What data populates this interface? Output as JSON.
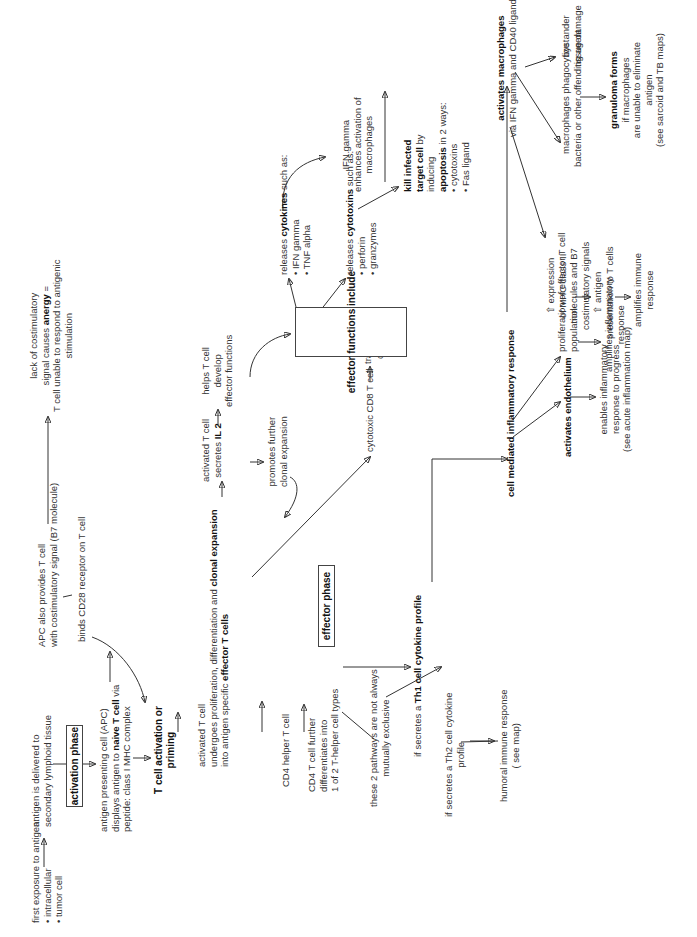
{
  "diagram": {
    "orientation": "rotated 90 degrees counter-clockwise",
    "boxes": {
      "activation_phase": "activation phase",
      "effector_phase": "effector phase",
      "effector_functions": "effector functions include"
    },
    "nodes": {
      "first_exposure": {
        "text": "first exposure to antigen:",
        "items": [
          "intracellular",
          "tumor cell"
        ]
      },
      "antigen_delivered": {
        "line1": "antigen is delivered to",
        "line2": "secondary lymphoid tissue"
      },
      "apc_displays": {
        "line1": "antigen presenting cell (APC)",
        "line2_pre": "displays antigen to ",
        "line2_bold": "naive T cell",
        "line2_post": " via",
        "line3": "peptide: class I MHC complex"
      },
      "apc_costim": {
        "line1": "APC also provides T cell",
        "line2": "with costimulatory signal (B7 molecule)"
      },
      "binds_cd28": "binds CD28 receptor on T cell",
      "anergy": {
        "line1": "lack of costimulatory",
        "line2_pre": "signal causes ",
        "line2_bold": "anergy",
        "line2_post": " =",
        "line3": "T cell unable to respond to antigenic",
        "line4": "stimulation"
      },
      "t_cell_activation": {
        "line1": "T cell activation or",
        "line2": "priming"
      },
      "activated_t_cell": {
        "line1": "activated T cell",
        "line2_pre": "undergoes proliferation, differentiation and ",
        "line2_bold": "clonal expansion",
        "line3_pre": "into antigen specific ",
        "line3_bold": "effector T cells"
      },
      "secretes_il2": {
        "line1": "activated T cell",
        "line2_pre": "secretes ",
        "line2_bold": "IL 2"
      },
      "promotes_clonal": {
        "line1": "promotes further",
        "line2": "clonal expansion"
      },
      "helps_t_cell": {
        "line1": "helps T cell",
        "line2": "develop",
        "line3": "effector functions"
      },
      "cd4_helper": "CD4 helper T cell",
      "cd4_differentiates": {
        "line1": "CD4 T cell further",
        "line2": "differentiates into",
        "line3": "1 of 2 T-helper cell types"
      },
      "pathways_note": {
        "line1": "these 2 pathways are not always",
        "line2": "mutually exclusive"
      },
      "cytotoxic_cd8": "cytotoxic CD8 T cell",
      "travels": {
        "line1": "travels to site",
        "line2": "of infection"
      },
      "releases_cytokines": {
        "pre": "releases ",
        "bold": "cytokines",
        "post": " such as:",
        "items": [
          "IFN gamma",
          "TNF alpha"
        ]
      },
      "releases_cytotoxins": {
        "pre": "releases ",
        "bold": "cytotoxins",
        "post": " such as:",
        "items": [
          "perforin",
          "granzymes"
        ]
      },
      "kill_infected": {
        "bold1": "kill infected",
        "bold2": "target cell",
        "post2": " by",
        "line3": "inducing",
        "bold4": "apoptosis",
        "post4": " in 2 ways:",
        "items": [
          "cytotoxins",
          "Fas ligand"
        ]
      },
      "ifn_gamma": {
        "line1": "IFN gamma",
        "line2": "enhances activation of",
        "line3": "macrophages"
      },
      "activates_macrophages": {
        "bold": "activates macrophages",
        "line2": "via IFN gamma and CD40 ligand"
      },
      "bystander": {
        "line1": "bystander",
        "line2": "tissue damage"
      },
      "phagocytize": {
        "line1": "macrophages phagocytize",
        "line2": "bacteria or other offending agent"
      },
      "granuloma": {
        "bold": "granuloma forms",
        "line2": "if macrophages",
        "line3": "are unable to eliminate",
        "line4": "antigen",
        "line5": "(see sarcoid and TB maps)"
      },
      "mhc_expression": {
        "line1": "⇧ expression",
        "line2": "of MHC class II",
        "line3": "molecules and B7",
        "line4": "costimulatory signals"
      },
      "antigen_presentation": {
        "line1": "⇧ antigen",
        "line2": "presentation to T cells"
      },
      "amplifies_immune": {
        "line1": "amplifies immune",
        "line2": "response"
      },
      "th1": {
        "pre": "if secretes a ",
        "bold": "Th1 cell cytokine profile"
      },
      "th2": {
        "line1": "if secretes a Th2 cell cytokine",
        "line2": "profile"
      },
      "humoral": {
        "line1": "humoral immune response",
        "line2": "( see map)"
      },
      "cell_mediated": "cell mediated inflammatory response",
      "activates_endothelium": "activates endothelium",
      "enables_inflammatory": {
        "line1": "enables inflammatory",
        "line2": "response to progress",
        "line3": "(see acute inflammation map)"
      },
      "proliferation_effector": {
        "line1": "proliferation of effector T cell",
        "line2": "population"
      },
      "amplifies_inflammatory": {
        "line1": "amplifies inflammatory",
        "line2": "response"
      }
    }
  }
}
